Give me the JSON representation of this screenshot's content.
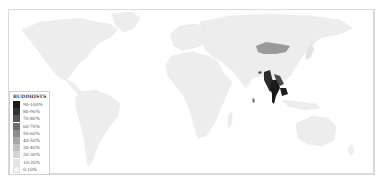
{
  "map": {
    "subject": "Buddhists share of population by country",
    "base_color": "#ededed",
    "ocean_color": "#ffffff",
    "highlighted_regions": [
      {
        "name": "Mongolia",
        "bin": "50-60%",
        "color": "#9a9a9a"
      },
      {
        "name": "Myanmar",
        "bin": "80-90%",
        "color": "#2b2b2b"
      },
      {
        "name": "Thailand",
        "bin": "90-100%",
        "color": "#1a1a1a"
      },
      {
        "name": "Cambodia",
        "bin": "90-100%",
        "color": "#1f1f1f"
      },
      {
        "name": "Laos",
        "bin": "60-70%",
        "color": "#6a6a6a"
      },
      {
        "name": "Bhutan",
        "bin": "70-80%",
        "color": "#555555"
      },
      {
        "name": "Sri Lanka",
        "bin": "70-80%",
        "color": "#7a7a7a"
      },
      {
        "name": "Japan",
        "bin": "30-40%",
        "color": "#d8d8d8"
      }
    ]
  },
  "legend": {
    "title": "BUDDHISTS",
    "items": [
      {
        "label": "90-100%",
        "color": "#1a1a1a"
      },
      {
        "label": "80-90%",
        "color": "#333333"
      },
      {
        "label": "70-80%",
        "color": "#555555"
      },
      {
        "label": "60-70%",
        "color": "#6e6e6e"
      },
      {
        "label": "50-60%",
        "color": "#8c8c8c"
      },
      {
        "label": "40-50%",
        "color": "#a8a8a8"
      },
      {
        "label": "30-40%",
        "color": "#c0c0c0"
      },
      {
        "label": "20-30%",
        "color": "#d4d4d4"
      },
      {
        "label": "10-20%",
        "color": "#e4e4e4"
      },
      {
        "label": "0-10%",
        "color": "#f4f4f4"
      }
    ]
  }
}
